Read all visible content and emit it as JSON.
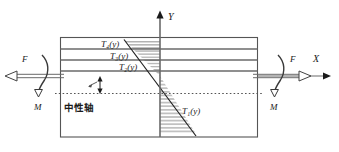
{
  "figure": {
    "axes": {
      "y_label": "Y",
      "x_label": "X"
    },
    "loads": {
      "force_left_label": "F",
      "force_right_label": "F",
      "moment_left_label": "M",
      "moment_right_label": "M"
    },
    "annotations": {
      "neutral_axis_label": "中性轴",
      "layer_labels": [
        "T₄(y)",
        "T₃(y)",
        "T₂(y)"
      ],
      "profile_label": "T₁(y)"
    },
    "colors": {
      "line": "#4d4d4d",
      "outline": "#555555",
      "text": "#1a1a1a",
      "hatch": "#555555",
      "dashed": "#555555",
      "background": "#ffffff"
    }
  }
}
